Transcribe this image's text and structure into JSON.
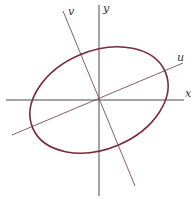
{
  "diagram": {
    "type": "rotated-ellipse-axes",
    "axes": {
      "x_label": "x",
      "y_label": "y",
      "u_label": "u",
      "v_label": "v"
    },
    "ellipse": {
      "center": [
        99,
        100
      ],
      "semi_major": 72,
      "semi_minor": 49,
      "rotation_deg": -22.8
    },
    "colors": {
      "axis": "#4a4a4a",
      "rotated_axis": "#7a4a58",
      "ellipse": "#7a2a3a",
      "background": "#ffffff"
    }
  }
}
